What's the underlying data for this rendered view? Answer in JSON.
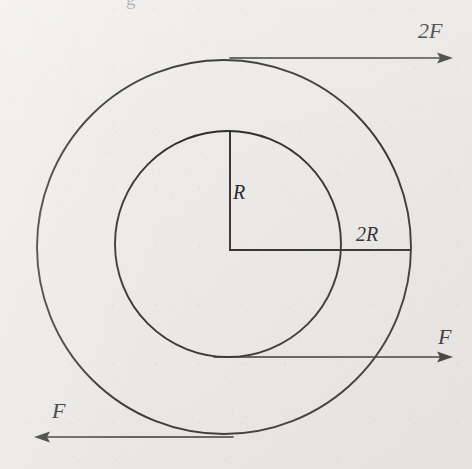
{
  "figure": {
    "kind": "physics-force-diagram",
    "background_color": "#edebe8",
    "ink_color": "#2a2a2a"
  },
  "geometry": {
    "outer_circle": {
      "cx": 224,
      "cy": 247,
      "r": 187,
      "label": "2R"
    },
    "inner_circle": {
      "cx": 228,
      "cy": 244,
      "r": 113,
      "label": "R"
    },
    "radius_line_vertical": {
      "x1": 230,
      "y1": 131,
      "x2": 230,
      "y2": 250,
      "label": "R"
    },
    "radius_line_horizontal": {
      "x1": 230,
      "y1": 250,
      "x2": 410,
      "y2": 250,
      "label": "2R"
    }
  },
  "labels": {
    "force_top": "2F",
    "radius_inner": "R",
    "radius_outer": "2R",
    "force_right": "F",
    "force_left": "F",
    "clipped_top_glyph": "g"
  },
  "arrows": [
    {
      "name": "force-top",
      "label": "2F",
      "magnitude": "2F",
      "direction": "right",
      "tangent_to": "outer_circle_top",
      "x_start": 230,
      "x_end": 452,
      "y": 58
    },
    {
      "name": "force-right",
      "label": "F",
      "magnitude": "F",
      "direction": "right",
      "tangent_to": "inner_circle_bottom",
      "x_start": 214,
      "x_end": 452,
      "y": 357
    },
    {
      "name": "force-left",
      "label": "F",
      "magnitude": "F",
      "direction": "left",
      "tangent_to": "outer_circle_bottom",
      "x_start": 233,
      "x_end": 34,
      "y": 437
    }
  ]
}
